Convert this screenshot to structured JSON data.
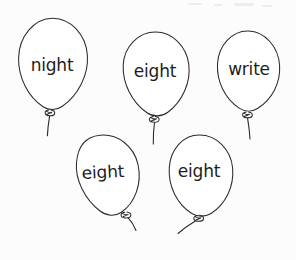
{
  "page": {
    "background_color": "#fcfcfc",
    "ink_color": "#2b2b2b",
    "text_color": "#1d1d1d",
    "width": 296,
    "height": 260
  },
  "balloons": [
    {
      "id": "balloon-1",
      "word": "night",
      "position": "top-left",
      "text_x": 52,
      "text_y": 66,
      "rotation_deg": 0
    },
    {
      "id": "balloon-2",
      "word": "eight",
      "position": "top-center",
      "text_x": 155,
      "text_y": 72,
      "rotation_deg": 0
    },
    {
      "id": "balloon-3",
      "word": "write",
      "position": "top-right",
      "text_x": 249,
      "text_y": 70,
      "rotation_deg": 0
    },
    {
      "id": "balloon-4",
      "word": "eight",
      "position": "bottom-left",
      "text_x": 103,
      "text_y": 173,
      "rotation_deg": -3
    },
    {
      "id": "balloon-5",
      "word": "eight",
      "position": "bottom-right",
      "text_x": 199,
      "text_y": 172,
      "rotation_deg": 0
    }
  ],
  "icons": {
    "balloon": "balloon-icon",
    "knot": "knot-icon",
    "string": "string-icon"
  }
}
